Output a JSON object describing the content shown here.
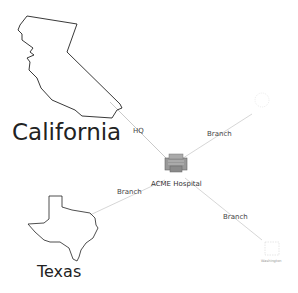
{
  "diagram": {
    "center": {
      "label": "ACME Hospital",
      "icon": "hospital-building-icon"
    },
    "nodes": [
      {
        "id": "california",
        "label": "California",
        "icon": "california-outline-icon"
      },
      {
        "id": "texas",
        "label": "Texas",
        "icon": "texas-outline-icon"
      },
      {
        "id": "top-right",
        "label": "",
        "icon": "faded-state-icon"
      },
      {
        "id": "washington",
        "label": "Washington",
        "icon": "faded-state-icon"
      }
    ],
    "edges": [
      {
        "from": "california",
        "to": "center",
        "label": "HQ"
      },
      {
        "from": "texas",
        "to": "center",
        "label": "Branch"
      },
      {
        "from": "top-right",
        "to": "center",
        "label": "Branch"
      },
      {
        "from": "washington",
        "to": "center",
        "label": "Branch"
      }
    ]
  }
}
